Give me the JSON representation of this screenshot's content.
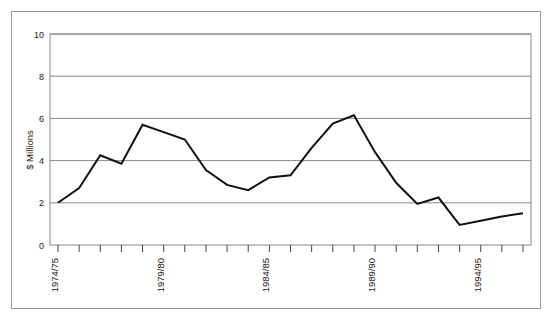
{
  "chart_data": {
    "type": "line",
    "title": "",
    "subtitle": "",
    "xlabel": "",
    "ylabel": "$ Millions",
    "ylim": [
      0,
      10
    ],
    "yticks": [
      0,
      2,
      4,
      6,
      8,
      10
    ],
    "ytick_labels": [
      "0",
      "2",
      "4",
      "6",
      "8",
      "10"
    ],
    "grid": "horizontal",
    "legend": "none",
    "x_tick_count": 23,
    "x_labeled_ticks": [
      {
        "index": 0,
        "label": "1974/75"
      },
      {
        "index": 5,
        "label": "1979/80"
      },
      {
        "index": 10,
        "label": "1984/85"
      },
      {
        "index": 15,
        "label": "1989/90"
      },
      {
        "index": 20,
        "label": "1994/95"
      }
    ],
    "xtick_labels_rotation": -90,
    "categories": [
      "1974/75",
      "1975/76",
      "1976/77",
      "1977/78",
      "1978/79",
      "1979/80",
      "1980/81",
      "1981/82",
      "1982/83",
      "1983/84",
      "1984/85",
      "1985/86",
      "1986/87",
      "1987/88",
      "1988/89",
      "1989/90",
      "1990/91",
      "1991/92",
      "1992/93",
      "1993/94",
      "1994/95",
      "1995/96",
      "1996/97"
    ],
    "series": [
      {
        "name": "Expenditure",
        "color": "#111111",
        "values": [
          2.0,
          2.7,
          4.25,
          3.85,
          5.7,
          5.35,
          5.0,
          3.55,
          2.85,
          2.6,
          3.2,
          3.3,
          4.6,
          5.75,
          6.15,
          4.4,
          2.95,
          1.95,
          2.25,
          0.95,
          1.15,
          1.35,
          1.5
        ]
      }
    ],
    "annotations": []
  }
}
